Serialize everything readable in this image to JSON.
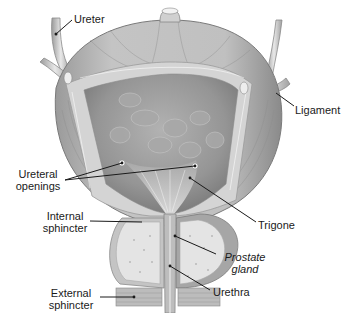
{
  "figure": {
    "labels": {
      "ureter": "Ureter",
      "ligament": "Ligament",
      "ureteral_openings_1": "Ureteral",
      "ureteral_openings_2": "openings",
      "trigone": "Trigone",
      "internal_sphincter_1": "Internal",
      "internal_sphincter_2": "sphincter",
      "prostate_gland_1": "Prostate",
      "prostate_gland_2": "gland",
      "external_sphincter_1": "External",
      "external_sphincter_2": "sphincter",
      "urethra": "Urethra"
    },
    "colors": {
      "background": "#ffffff",
      "muscle_wall": "#b8b8b8",
      "muscle_dark": "#8e8e8e",
      "lumen": "#9c9c9c",
      "mucosa_band": "#d6d6d6",
      "prostate": "#e2e2e2",
      "leader_line": "#1a1a1a",
      "text": "#1a1a1a"
    }
  }
}
